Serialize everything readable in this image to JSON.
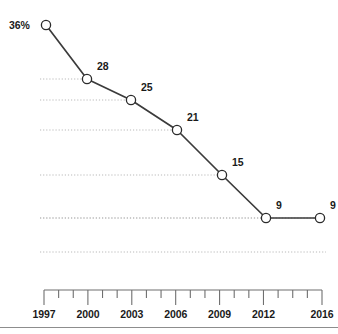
{
  "chart_data": {
    "type": "line",
    "title": "",
    "subtitle": "",
    "xlabel": "",
    "ylabel": "",
    "x": [
      1997,
      2000,
      2003,
      2006,
      2009,
      2012,
      2016
    ],
    "categories": [
      "1997",
      "2000",
      "2003",
      "2006",
      "2009",
      "2012",
      "2016"
    ],
    "values": [
      36,
      28,
      25,
      21,
      15,
      9,
      9
    ],
    "point_labels": [
      "36%",
      "28",
      "25",
      "21",
      "15",
      "9",
      "9"
    ],
    "series": [
      {
        "name": "",
        "values": [
          36,
          28,
          25,
          21,
          15,
          9,
          9
        ]
      }
    ],
    "ylim": [
      0,
      38
    ],
    "xlim": [
      1997,
      2016
    ],
    "grid": "horizontal-dotted",
    "legend": "none",
    "marker": "open-circle",
    "line_color": "#3b3b3b",
    "marker_fill": "#ffffff",
    "marker_stroke": "#2b2b2b",
    "grid_color": "#b9b9b9",
    "axis_color": "#6f6f6f",
    "text_color": "#1a1a1a",
    "background": "#ffffff"
  },
  "axis": {
    "ticks": [
      {
        "label": "1997",
        "major": true
      },
      {
        "label": "",
        "major": false
      },
      {
        "label": "",
        "major": false
      },
      {
        "label": "2000",
        "major": true
      },
      {
        "label": "",
        "major": false
      },
      {
        "label": "",
        "major": false
      },
      {
        "label": "2003",
        "major": true
      },
      {
        "label": "",
        "major": false
      },
      {
        "label": "",
        "major": false
      },
      {
        "label": "2006",
        "major": true
      },
      {
        "label": "",
        "major": false
      },
      {
        "label": "",
        "major": false
      },
      {
        "label": "2009",
        "major": true
      },
      {
        "label": "",
        "major": false
      },
      {
        "label": "",
        "major": false
      },
      {
        "label": "2012",
        "major": true
      },
      {
        "label": "",
        "major": false
      },
      {
        "label": "",
        "major": false
      },
      {
        "label": "",
        "major": false
      },
      {
        "label": "2016",
        "major": true
      }
    ],
    "labels": [
      "1997",
      "2000",
      "2003",
      "2006",
      "2009",
      "2012",
      "2016"
    ]
  },
  "points": [
    {
      "label": "36%",
      "label_side": "left",
      "x": 46,
      "y": 25
    },
    {
      "label": "28",
      "label_side": "right",
      "x": 87,
      "y": 79
    },
    {
      "label": "25",
      "label_side": "right",
      "x": 131,
      "y": 100
    },
    {
      "label": "21",
      "label_side": "right",
      "x": 177,
      "y": 130
    },
    {
      "label": "15",
      "label_side": "right",
      "x": 222,
      "y": 175
    },
    {
      "label": "9",
      "label_side": "right",
      "x": 266,
      "y": 218
    },
    {
      "label": "9",
      "label_side": "right",
      "x": 320,
      "y": 218
    }
  ]
}
